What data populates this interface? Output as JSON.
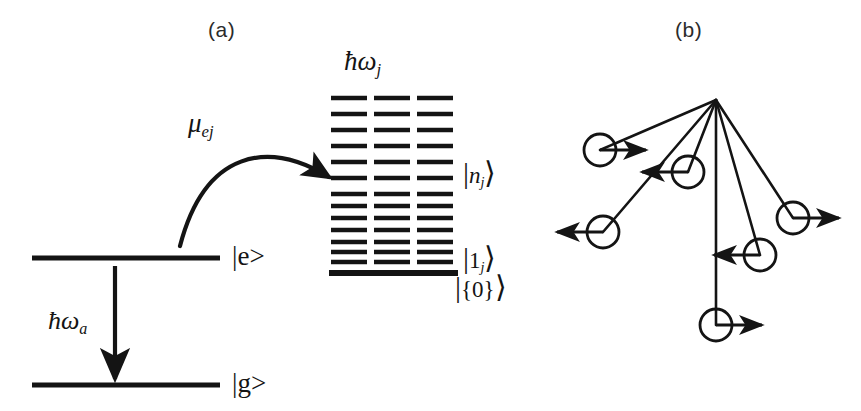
{
  "figure": {
    "width": 861,
    "height": 411,
    "background": "#ffffff",
    "ink": "#141414"
  },
  "panels": {
    "a": {
      "label": "(a)",
      "label_x": 208,
      "label_y": 18
    },
    "b": {
      "label": "(b)",
      "label_x": 675,
      "label_y": 18
    }
  },
  "atom_levels": {
    "excited": {
      "name": "excited-state-level",
      "label": "|e>",
      "x1": 32,
      "x2": 220,
      "y": 258,
      "label_x": 232,
      "label_y": 243
    },
    "ground": {
      "name": "ground-state-level",
      "label": "|g>",
      "x1": 32,
      "x2": 220,
      "y": 385,
      "label_x": 232,
      "label_y": 370
    }
  },
  "emission_arrow": {
    "name": "emission-arrow",
    "x": 115,
    "y_start": 266,
    "y_end": 379,
    "label": "ħω",
    "label_sub": "a",
    "label_x": 48,
    "label_y": 308
  },
  "coupling_arrow": {
    "name": "coupling-arrow",
    "label": "μ",
    "label_sub": "ej",
    "label_x": 188,
    "label_y": 110,
    "start_x": 180,
    "start_y": 246,
    "ctrl1_x": 205,
    "ctrl1_y": 150,
    "ctrl2_x": 268,
    "ctrl2_y": 140,
    "end_x": 329,
    "end_y": 177
  },
  "vibrational_ladder": {
    "name": "vibrational-ladder",
    "header_label": "ħω",
    "header_sub": "j",
    "header_x": 344,
    "header_y": 48,
    "columns_x": [
      331,
      374,
      417
    ],
    "line_width": 36,
    "baseline": {
      "y": 273,
      "x1": 329,
      "x2": 458,
      "thickness": 6
    },
    "level_rows_y": [
      98,
      114,
      130,
      146,
      162,
      178,
      194,
      206,
      218,
      230,
      242,
      252,
      262
    ],
    "labels": {
      "n_state": {
        "text": "n",
        "sub": "j",
        "x": 463,
        "y": 158
      },
      "one_state": {
        "text": "1",
        "sub": "j",
        "x": 463,
        "y": 243
      },
      "zero_state": {
        "text": "{0}",
        "x": 455,
        "y": 272
      }
    }
  },
  "radiating_diagram": {
    "name": "radiating-diagram",
    "hub_x": 716,
    "hub_y": 100,
    "circle_radius": 16,
    "nodes": [
      {
        "name": "node-upper-left",
        "cx": 600,
        "cy": 150,
        "arrow": "right"
      },
      {
        "name": "node-inner-left",
        "cx": 688,
        "cy": 172,
        "arrow": "left"
      },
      {
        "name": "node-lower-left",
        "cx": 603,
        "cy": 232,
        "arrow": "left"
      },
      {
        "name": "node-right",
        "cx": 793,
        "cy": 218,
        "arrow": "right"
      },
      {
        "name": "node-inner-right",
        "cx": 760,
        "cy": 255,
        "arrow": "left"
      },
      {
        "name": "node-bottom",
        "cx": 716,
        "cy": 325,
        "arrow": "right"
      }
    ],
    "arrow_length": 46
  }
}
